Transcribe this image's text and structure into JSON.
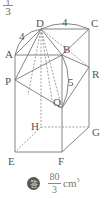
{
  "header_fraction": {
    "numerator": "1",
    "denominator": "3"
  },
  "figure": {
    "vertices": {
      "A": "A",
      "B": "B",
      "C": "C",
      "D": "D",
      "E": "E",
      "F": "F",
      "G": "G",
      "H": "H",
      "P": "P",
      "Q": "Q",
      "R": "R"
    },
    "dimensions": {
      "DC": "4",
      "AD": "4",
      "BQ": "5"
    }
  },
  "answer": {
    "badge": "答",
    "numerator": "80",
    "denominator": "3",
    "unit": "cm",
    "unit_exp": "3"
  }
}
